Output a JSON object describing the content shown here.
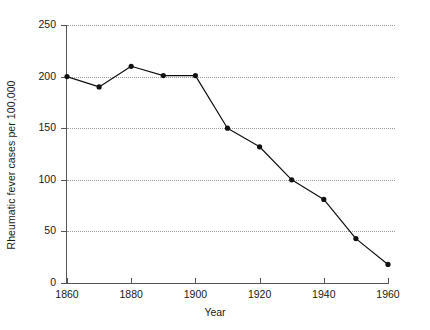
{
  "chart_data": {
    "type": "line",
    "title": "",
    "xlabel": "Year",
    "ylabel": "Rheumatic fever cases per 100,000",
    "x": [
      1860,
      1870,
      1880,
      1890,
      1900,
      1910,
      1920,
      1930,
      1940,
      1950,
      1960
    ],
    "values": [
      200,
      190,
      210,
      201,
      201,
      150,
      132,
      100,
      81,
      43,
      18
    ],
    "series": [
      {
        "name": "Rheumatic fever incidence",
        "values": [
          200,
          190,
          210,
          201,
          201,
          150,
          132,
          100,
          81,
          43,
          18
        ]
      }
    ],
    "xlim": [
      1860,
      1960
    ],
    "ylim": [
      0,
      250
    ],
    "xticks": [
      1860,
      1880,
      1900,
      1920,
      1940,
      1960
    ],
    "xtick_labels": [
      "1860",
      "1880",
      "1900",
      "1920",
      "1940",
      "1960"
    ],
    "yticks": [
      0,
      50,
      100,
      150,
      200,
      250
    ],
    "ytick_labels": [
      "0",
      "50",
      "100",
      "150",
      "200",
      "250"
    ],
    "grid": "horizontal-dotted",
    "legend": "none",
    "marker": "filled-circle",
    "line_color": "#111111",
    "grid_color": "#9a9a9a",
    "axis_color": "#555555"
  }
}
